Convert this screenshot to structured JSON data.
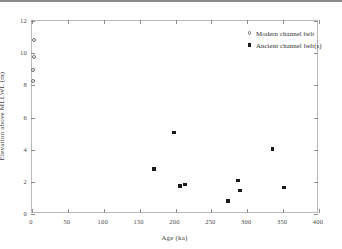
{
  "chart_data": {
    "type": "scatter",
    "title": "",
    "xlabel": "Age (ka)",
    "ylabel": "Elevation above MLLWL (m)",
    "xlim": [
      0,
      400
    ],
    "ylim": [
      0,
      12
    ],
    "xticks": [
      0,
      50,
      100,
      150,
      200,
      250,
      300,
      350,
      400
    ],
    "yticks": [
      0,
      2,
      4,
      6,
      8,
      10,
      12
    ],
    "xtick_labels": [
      "0",
      "50",
      "100",
      "150",
      "200",
      "250",
      "300",
      "350",
      "400"
    ],
    "ytick_labels": [
      "0",
      "2",
      "4",
      "6",
      "8",
      "10",
      "12"
    ],
    "grid": false,
    "legend_position": "top-right",
    "series": [
      {
        "name": "Modern channel belt",
        "marker": "open-circle",
        "color": "#6d6d6d",
        "points": [
          {
            "x": 3,
            "y": 10.8
          },
          {
            "x": 3,
            "y": 9.75
          },
          {
            "x": 2,
            "y": 8.95
          },
          {
            "x": 2,
            "y": 8.3
          }
        ]
      },
      {
        "name": "Ancient channel belt(s)",
        "marker": "filled-square",
        "color": "#1a1a1a",
        "points": [
          {
            "x": 198,
            "y": 5.05
          },
          {
            "x": 335,
            "y": 4.05
          },
          {
            "x": 170,
            "y": 2.8
          },
          {
            "x": 287,
            "y": 2.1
          },
          {
            "x": 213,
            "y": 1.85
          },
          {
            "x": 206,
            "y": 1.75
          },
          {
            "x": 351,
            "y": 1.65
          },
          {
            "x": 290,
            "y": 1.45
          },
          {
            "x": 273,
            "y": 0.8
          }
        ]
      }
    ]
  },
  "legend": {
    "items": [
      {
        "label": "Modern channel belt"
      },
      {
        "label": "Ancient channel belt(s)"
      }
    ]
  }
}
